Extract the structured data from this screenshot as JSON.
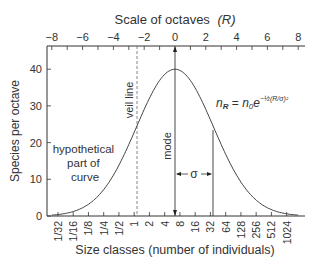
{
  "chart_data": {
    "type": "line",
    "title": "",
    "top_axis": {
      "label": "Scale of octaves",
      "label_var": "(R)",
      "ticks": [
        -8,
        -6,
        -4,
        -2,
        0,
        2,
        4,
        6,
        8
      ],
      "tick_labels": [
        "−8",
        "−6",
        "−4",
        "−2",
        "0",
        "2",
        "4",
        "6",
        "8"
      ]
    },
    "xlabel": "Size classes (number of individuals)",
    "ylabel": "Species per octave",
    "x_categories": [
      "1/32",
      "1/16",
      "1/8",
      "1/4",
      "1/2",
      "1",
      "2",
      "4",
      "8",
      "16",
      "32",
      "64",
      "128",
      "256",
      "512",
      "1024"
    ],
    "y_ticks": [
      0,
      10,
      20,
      30,
      40
    ],
    "y_tick_labels": [
      "0",
      "10",
      "20",
      "30",
      "40"
    ],
    "ylim": [
      0,
      46
    ],
    "xlim_octaves": [
      -8,
      8.5
    ],
    "series": [
      {
        "name": "lognormal species abundance curve",
        "n0": 40,
        "sigma_octaves": 2.5,
        "mode_octave": 0,
        "x_octaves": [
          -8,
          -7,
          -6,
          -5,
          -4,
          -3,
          -2,
          -1,
          0,
          1,
          2,
          3,
          4,
          5,
          6,
          7,
          8
        ],
        "values": [
          0.2,
          0.8,
          2.2,
          5.4,
          11.1,
          19.5,
          29.0,
          36.9,
          40.0,
          36.9,
          29.0,
          19.5,
          11.1,
          5.4,
          2.2,
          0.8,
          0.2
        ]
      }
    ],
    "annotations": {
      "veil_line": {
        "label": "veil line",
        "octave": -2.5
      },
      "mode": {
        "label": "mode",
        "octave": 0
      },
      "sigma": {
        "label": "σ",
        "from_octave": 0,
        "to_octave": 2.5
      },
      "hypothetical": {
        "lines": [
          "hypothetical",
          "part of",
          "curve"
        ]
      },
      "formula": {
        "lhs": "n",
        "lhs_sub": "R",
        "eq": " = ",
        "rhs": "n",
        "rhs_sub": "0",
        "e": "e",
        "exp": "−½(R/σ)²"
      }
    },
    "grid": false,
    "legend": "none"
  }
}
